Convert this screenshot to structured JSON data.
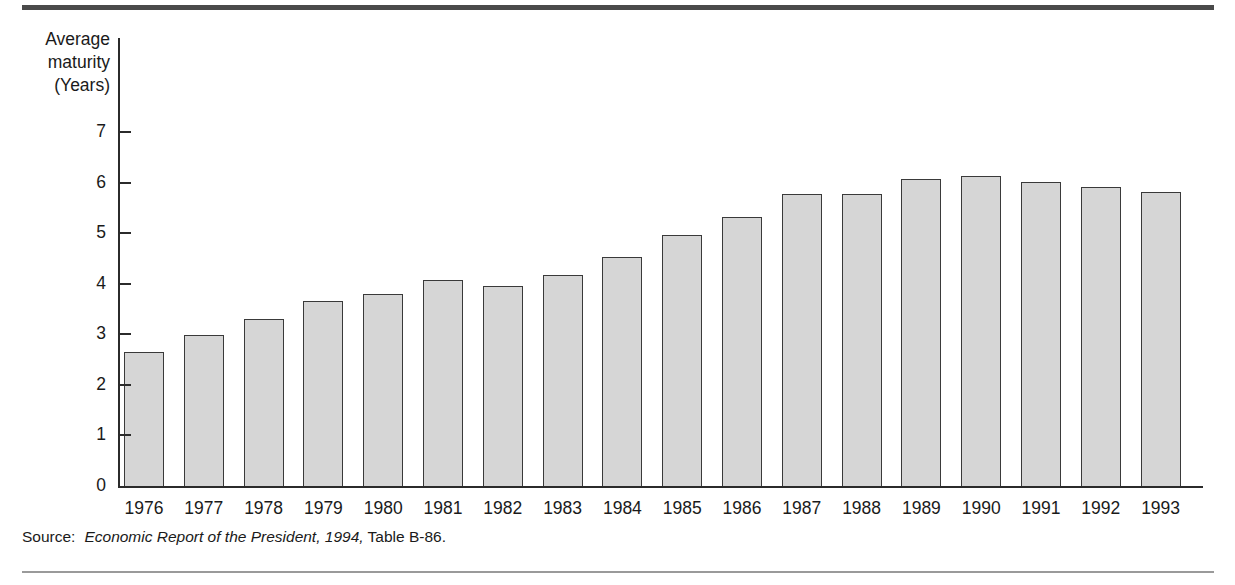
{
  "figure": {
    "background": "#ffffff",
    "rule_color_top": "#4a4a4a",
    "rule_color_bottom": "#9a9a9a",
    "bar_fill": "#d6d6d6",
    "bar_border": "#3a3a3a",
    "axis_color": "#2b2b2b"
  },
  "axis_title": {
    "line1": "Average",
    "line2": "maturity",
    "line3": "(Years)"
  },
  "source": {
    "label": "Source:",
    "italic_part": "Economic Report of the President, 1994,",
    "tail_part": " Table B-86."
  },
  "chart_data": {
    "type": "bar",
    "title": "",
    "subtitle": "",
    "xlabel": "",
    "ylabel": "Average maturity (Years)",
    "categories": [
      "1976",
      "1977",
      "1978",
      "1979",
      "1980",
      "1981",
      "1982",
      "1983",
      "1984",
      "1985",
      "1986",
      "1987",
      "1988",
      "1989",
      "1990",
      "1991",
      "1992",
      "1993"
    ],
    "values": [
      2.65,
      2.99,
      3.3,
      3.66,
      3.8,
      4.07,
      3.96,
      4.17,
      4.53,
      4.97,
      5.32,
      5.78,
      5.78,
      6.07,
      6.13,
      6.02,
      5.92,
      5.81
    ],
    "ylim": [
      0,
      7
    ],
    "yticks": [
      0,
      1,
      2,
      3,
      4,
      5,
      6,
      7
    ],
    "ytick_labels": [
      "0",
      "1",
      "2",
      "3",
      "4",
      "5",
      "6",
      "7"
    ],
    "grid": false,
    "legend": false,
    "legend_position": "none",
    "series": [
      {
        "name": "Average maturity",
        "values": [
          2.65,
          2.99,
          3.3,
          3.66,
          3.8,
          4.07,
          3.96,
          4.17,
          4.53,
          4.97,
          5.32,
          5.78,
          5.78,
          6.07,
          6.13,
          6.02,
          5.92,
          5.81
        ]
      }
    ]
  }
}
